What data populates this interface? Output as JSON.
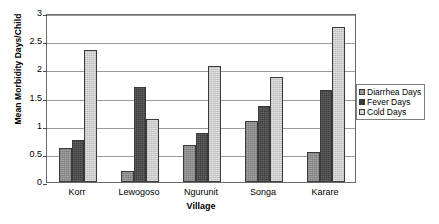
{
  "chart_data": {
    "type": "bar",
    "title": "",
    "xlabel": "Village",
    "ylabel": "Mean Morbidity Days/Child",
    "categories": [
      "Korr",
      "Lewogoso",
      "Ngurunit",
      "Songa",
      "Karare"
    ],
    "series": [
      {
        "name": "Diarrhea Days",
        "color": "#8e8e8e",
        "values": [
          0.6,
          0.2,
          0.65,
          1.08,
          0.53
        ]
      },
      {
        "name": "Fever Days",
        "color": "#3b3b3b",
        "values": [
          0.75,
          1.68,
          0.87,
          1.35,
          1.64
        ]
      },
      {
        "name": "Cold Days",
        "color": "#cbcbcb",
        "values": [
          2.35,
          1.12,
          2.06,
          1.86,
          2.76
        ]
      }
    ],
    "ylim": [
      0,
      3
    ],
    "yticks": [
      0,
      0.5,
      1,
      1.5,
      2,
      2.5,
      3
    ],
    "ytick_labels": [
      "0",
      "0.5",
      "1",
      "1.5",
      "2",
      "2.5",
      "3"
    ],
    "grid": true,
    "legend_position": "right",
    "legend_entries": [
      "Diarrhea Days",
      "Fever Days",
      "Cold Days"
    ]
  }
}
